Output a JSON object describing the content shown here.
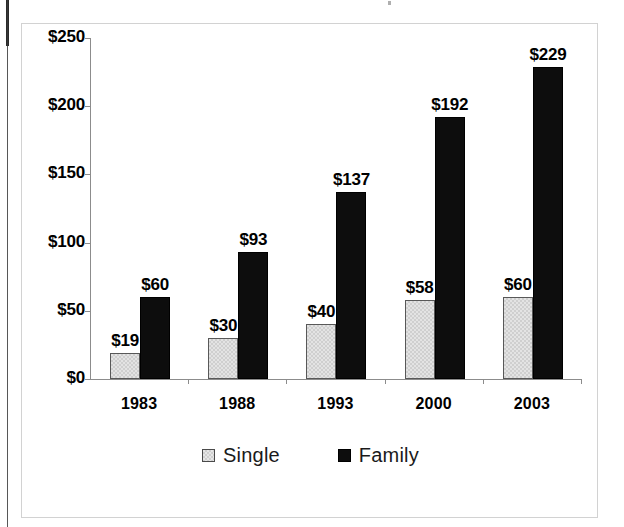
{
  "chart_data": {
    "type": "bar",
    "title": "",
    "xlabel": "",
    "ylabel": "",
    "ylim": [
      0,
      250
    ],
    "ytick_values": [
      0,
      50,
      100,
      150,
      200,
      250
    ],
    "ytick_labels": [
      "$0",
      "$50",
      "$100",
      "$150",
      "$200",
      "$250"
    ],
    "categories": [
      "1983",
      "1988",
      "1993",
      "2000",
      "2003"
    ],
    "grid": false,
    "legend_position": "bottom",
    "series": [
      {
        "name": "Single",
        "color": "#dadada",
        "values": [
          19,
          30,
          40,
          58,
          60
        ],
        "data_labels": [
          "$19",
          "$30",
          "$40",
          "$58",
          "$60"
        ]
      },
      {
        "name": "Family",
        "color": "#0d0d0d",
        "values": [
          60,
          93,
          137,
          192,
          229
        ],
        "data_labels": [
          "$60",
          "$93",
          "$137",
          "$192",
          "$229"
        ]
      }
    ]
  },
  "colors": {
    "single_fill": "#dadada",
    "single_border": "#585858",
    "family_fill": "#0d0d0d",
    "axis": "#8c8c8c",
    "frame": "#d2d2d2",
    "text": "#000000"
  }
}
